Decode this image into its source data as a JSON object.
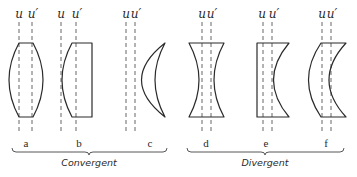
{
  "diagram": {
    "axis_labels": {
      "u": "u",
      "u_prime": "u′"
    },
    "groups": [
      {
        "name": "Convergent",
        "lenses": [
          "a",
          "b",
          "c"
        ]
      },
      {
        "name": "Divergent",
        "lenses": [
          "d",
          "e",
          "f"
        ]
      }
    ],
    "lenses": [
      {
        "id": "a",
        "label": "a",
        "type": "biconvex"
      },
      {
        "id": "b",
        "label": "b",
        "type": "plano-convex"
      },
      {
        "id": "c",
        "label": "c",
        "type": "convergent-meniscus"
      },
      {
        "id": "d",
        "label": "d",
        "type": "biconcave"
      },
      {
        "id": "e",
        "label": "e",
        "type": "plano-concave"
      },
      {
        "id": "f",
        "label": "f",
        "type": "divergent-meniscus"
      }
    ]
  }
}
